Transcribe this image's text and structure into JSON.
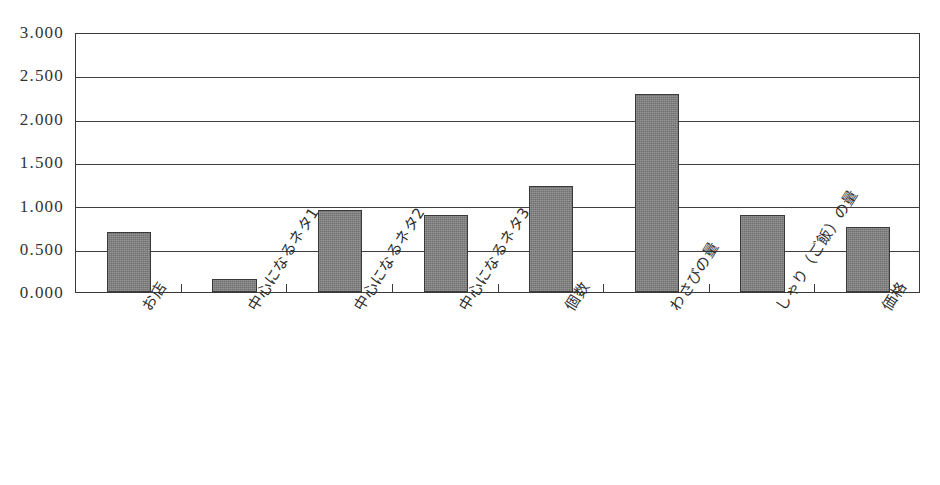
{
  "chart_data": {
    "type": "bar",
    "title": "",
    "subtitle": "",
    "xlabel": "",
    "ylabel": "",
    "ylim": [
      0.0,
      3.0
    ],
    "ytick_labels": [
      "3.000",
      "2.500",
      "2.000",
      "1.500",
      "1.000",
      "0.500",
      "0.000"
    ],
    "ytick_values": [
      3.0,
      2.5,
      2.0,
      1.5,
      1.0,
      0.5,
      0.0
    ],
    "grid": true,
    "legend": false,
    "legend_position": "none",
    "bar_color": "#7d7d7d",
    "bar_border_color": "#3a3a3a",
    "axis_color": "#3a3a3a",
    "categories": [
      "お店",
      "中心になるネタ1",
      "中心になるネタ2",
      "中心になるネタ3",
      "個数",
      "わさびの量",
      "しゃり（ご飯）の量",
      "価格"
    ],
    "values": [
      0.69,
      0.15,
      0.95,
      0.89,
      1.22,
      2.29,
      0.89,
      0.75
    ]
  }
}
